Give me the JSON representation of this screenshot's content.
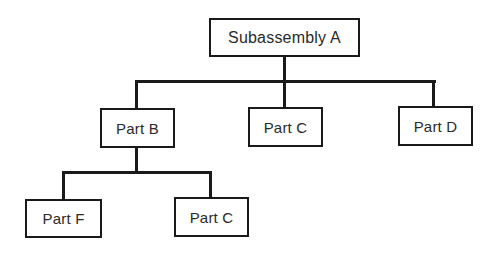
{
  "diagram": {
    "type": "hierarchy-tree",
    "root": {
      "label": "Subassembly A",
      "children": [
        {
          "label": "Part B",
          "children": [
            {
              "label": "Part F"
            },
            {
              "label": "Part C"
            }
          ]
        },
        {
          "label": "Part C"
        },
        {
          "label": "Part D"
        }
      ]
    },
    "nodes": {
      "subassembly_a": "Subassembly A",
      "part_b": "Part B",
      "part_c_level1": "Part C",
      "part_d": "Part D",
      "part_f": "Part F",
      "part_c_level2": "Part C"
    },
    "colors": {
      "line": "#1a1a1a",
      "box_border": "#1a1a1a",
      "text": "#2a2a2a",
      "background": "#ffffff"
    }
  }
}
